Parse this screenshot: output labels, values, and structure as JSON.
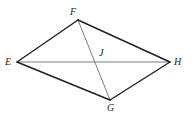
{
  "figure": {
    "name": "quadrilateral-efgh-with-diagonals",
    "width": 196,
    "height": 119,
    "background_color": "#ffffff",
    "stroke_color_outer": "#231f20",
    "stroke_color_diagonal": "#6d6e71",
    "stroke_width_outer": 1.4,
    "stroke_width_diagonal": 0.9,
    "vertices": [
      {
        "id": "E",
        "label": "E",
        "x": 17,
        "y": 62,
        "label_x": 5,
        "label_y": 57
      },
      {
        "id": "F",
        "label": "F",
        "x": 78,
        "y": 20,
        "label_x": 70,
        "label_y": 7
      },
      {
        "id": "G",
        "label": "G",
        "x": 110,
        "y": 100,
        "label_x": 107,
        "label_y": 103
      },
      {
        "id": "H",
        "label": "H",
        "x": 170,
        "y": 62,
        "label_x": 174,
        "label_y": 57
      },
      {
        "id": "J",
        "label": "J",
        "x": 96,
        "y": 62,
        "label_x": 99,
        "label_y": 48
      }
    ],
    "edges": [
      {
        "id": "EF",
        "from": "E",
        "to": "F",
        "kind": "outer"
      },
      {
        "id": "FH",
        "from": "F",
        "to": "H",
        "kind": "outer"
      },
      {
        "id": "HG",
        "from": "H",
        "to": "G",
        "kind": "outer"
      },
      {
        "id": "GE",
        "from": "G",
        "to": "E",
        "kind": "outer"
      }
    ],
    "diagonals": [
      {
        "id": "EH",
        "from": "E",
        "to": "H",
        "kind": "diagonal"
      },
      {
        "id": "FG",
        "from": "F",
        "to": "G",
        "kind": "diagonal"
      }
    ],
    "intersection": {
      "id": "J",
      "label": "J",
      "x": 96,
      "y": 62
    }
  }
}
